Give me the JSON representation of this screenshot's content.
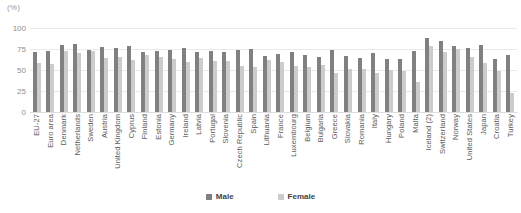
{
  "unit_label": "(%)",
  "legend": {
    "male": "Male",
    "female": "Female",
    "male_color": "#808080",
    "female_color": "#cccccc"
  },
  "chart_data": {
    "type": "bar",
    "title": "",
    "subtitle": "",
    "xlabel": "",
    "ylabel": "(%)",
    "ylim": [
      0,
      100
    ],
    "yticks": [
      0,
      25,
      50,
      75,
      100
    ],
    "grid": true,
    "legend_position": "bottom-center",
    "categories": [
      "EU-27",
      "Euro area",
      "Denmark",
      "Netherlands",
      "Sweden",
      "Austria",
      "United Kingdom",
      "Cyprus",
      "Finland",
      "Estonia",
      "Germany",
      "Ireland",
      "Latvia",
      "Portugal",
      "Slovenia",
      "Czech Republic",
      "Spain",
      "Lithuania",
      "France",
      "Luxembourg",
      "Belgium",
      "Bulgaria",
      "Greece",
      "Slovakia",
      "Romania",
      "Italy",
      "Hungary",
      "Poland",
      "Malta",
      "Iceland (2)",
      "Switzerland",
      "Norway",
      "United States",
      "Japan",
      "Croatia",
      "Turkey"
    ],
    "series": [
      {
        "name": "Male",
        "color": "#808080",
        "values": [
          72,
          73,
          80,
          81,
          74,
          77,
          76,
          79,
          72,
          73,
          74,
          76,
          72,
          73,
          72,
          74,
          75,
          67,
          69,
          72,
          68,
          65,
          74,
          67,
          64,
          70,
          63,
          63,
          73,
          88,
          84,
          78,
          76,
          80,
          63,
          68
        ]
      },
      {
        "name": "Female",
        "color": "#cccccc",
        "values": [
          58,
          57,
          73,
          70,
          73,
          64,
          65,
          62,
          68,
          65,
          63,
          59,
          64,
          61,
          61,
          55,
          53,
          62,
          59,
          55,
          54,
          56,
          47,
          51,
          51,
          46,
          50,
          49,
          36,
          79,
          71,
          75,
          65,
          58,
          49,
          23
        ]
      }
    ]
  }
}
